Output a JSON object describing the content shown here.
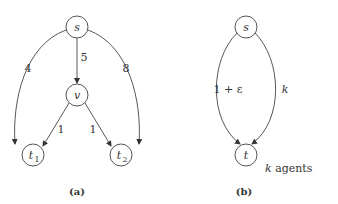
{
  "panel_a": {
    "caption": "(a)",
    "nodes": {
      "s": "s",
      "v": "v",
      "t1": "t",
      "t1_sub": "1",
      "t2": "t",
      "t2_sub": "2"
    },
    "edges": {
      "s_t1": "4",
      "s_v": "5",
      "s_t2": "8",
      "v_t1": "1",
      "v_t2": "1"
    }
  },
  "panel_b": {
    "caption": "(b)",
    "nodes": {
      "s": "s",
      "t": "t"
    },
    "edges": {
      "left": "1 + ε",
      "right": "k"
    },
    "annotation_k": "k",
    "annotation_rest": " agents"
  }
}
